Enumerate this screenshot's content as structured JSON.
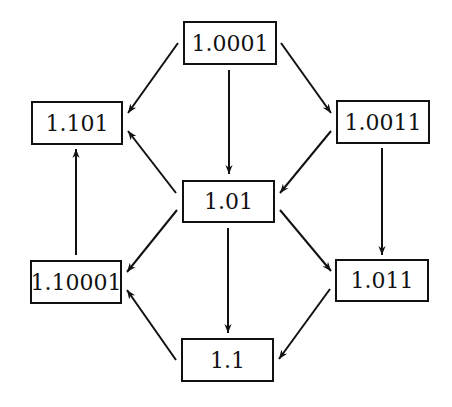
{
  "diagram": {
    "type": "directed-graph",
    "nodes": [
      {
        "id": "n1",
        "label": "1.0001",
        "x": 183,
        "y": 21,
        "w": 94,
        "h": 44
      },
      {
        "id": "n2",
        "label": "1.101",
        "x": 31,
        "y": 101,
        "w": 92,
        "h": 44
      },
      {
        "id": "n3",
        "label": "1.0011",
        "x": 336,
        "y": 100,
        "w": 94,
        "h": 44
      },
      {
        "id": "n4",
        "label": "1.01",
        "x": 182,
        "y": 180,
        "w": 93,
        "h": 43
      },
      {
        "id": "n5",
        "label": "1.10001",
        "x": 30,
        "y": 260,
        "w": 92,
        "h": 44
      },
      {
        "id": "n6",
        "label": "1.011",
        "x": 335,
        "y": 259,
        "w": 94,
        "h": 43
      },
      {
        "id": "n7",
        "label": "1.1",
        "x": 181,
        "y": 338,
        "w": 93,
        "h": 44
      }
    ],
    "edges": [
      {
        "from": "1.0001",
        "to": "1.101",
        "x1": 178,
        "y1": 43,
        "x2": 128,
        "y2": 113
      },
      {
        "from": "1.0001",
        "to": "1.01",
        "x1": 229,
        "y1": 70,
        "x2": 229,
        "y2": 174
      },
      {
        "from": "1.0001",
        "to": "1.0011",
        "x1": 281,
        "y1": 43,
        "x2": 331,
        "y2": 113
      },
      {
        "from": "1.0011",
        "to": "1.01",
        "x1": 331,
        "y1": 131,
        "x2": 280,
        "y2": 193
      },
      {
        "from": "1.01",
        "to": "1.101",
        "x1": 176,
        "y1": 193,
        "x2": 128,
        "y2": 131
      },
      {
        "from": "1.0011",
        "to": "1.011",
        "x1": 382,
        "y1": 148,
        "x2": 382,
        "y2": 255
      },
      {
        "from": "1.10001",
        "to": "1.101",
        "x1": 76,
        "y1": 255,
        "x2": 76,
        "y2": 149
      },
      {
        "from": "1.01",
        "to": "1.10001",
        "x1": 177,
        "y1": 210,
        "x2": 127,
        "y2": 272
      },
      {
        "from": "1.01",
        "to": "1.1",
        "x1": 228,
        "y1": 228,
        "x2": 228,
        "y2": 333
      },
      {
        "from": "1.01",
        "to": "1.011",
        "x1": 280,
        "y1": 210,
        "x2": 331,
        "y2": 271
      },
      {
        "from": "1.011",
        "to": "1.1",
        "x1": 330,
        "y1": 289,
        "x2": 279,
        "y2": 359
      },
      {
        "from": "1.1",
        "to": "1.10001",
        "x1": 176,
        "y1": 360,
        "x2": 127,
        "y2": 290
      }
    ]
  },
  "labels": {
    "n1": "1.0001",
    "n2": "1.101",
    "n3": "1.0011",
    "n4": "1.01",
    "n5": "1.10001",
    "n6": "1.011",
    "n7": "1.1"
  }
}
